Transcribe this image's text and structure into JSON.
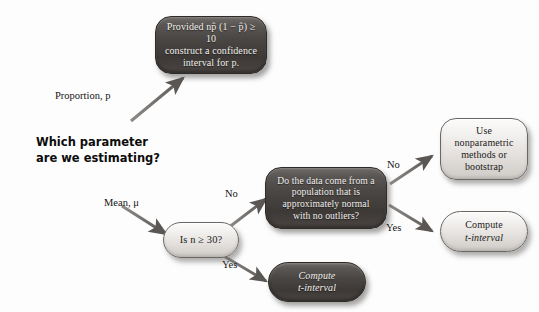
{
  "diagram": {
    "title": "Which parameter are we estimating?",
    "type": "decision-flowchart"
  },
  "root_question": {
    "line1": "Which parameter",
    "line2": "are we estimating?"
  },
  "branch_labels": {
    "proportion": "Proportion, p",
    "mean": "Mean, μ"
  },
  "nodes": {
    "proportion_ci": {
      "line1": "Provided np̂ (1 − p̂) ≥ 10",
      "line2": "construct a confidence",
      "line3": "interval for p.",
      "style": "dark"
    },
    "sample_size": {
      "text": "Is n ≥ 30?",
      "style": "light"
    },
    "normality": {
      "line1": "Do the data come from a",
      "line2": "population that is",
      "line3": "approximately normal",
      "line4": "with no outliers?",
      "style": "dark"
    },
    "nonparametric": {
      "line1": "Use",
      "line2": "nonparametric",
      "line3": "methods or",
      "line4": "bootstrap",
      "style": "light"
    },
    "t_interval_right": {
      "line1": "Compute",
      "line2": "t-interval",
      "style": "light"
    },
    "t_interval_bottom": {
      "line1": "Compute",
      "line2": "t-interval",
      "style": "dark"
    }
  },
  "edges": {
    "n30_no": "No",
    "n30_yes": "Yes",
    "normal_no": "No",
    "normal_yes": "Yes"
  },
  "colors": {
    "dark_node": "#4a4643",
    "light_node": "#e8e5e2",
    "text_light": "#f2f0ee",
    "text_dark": "#1c1a19",
    "arrow": "#5f5c59",
    "background": "#fdfdfd"
  }
}
